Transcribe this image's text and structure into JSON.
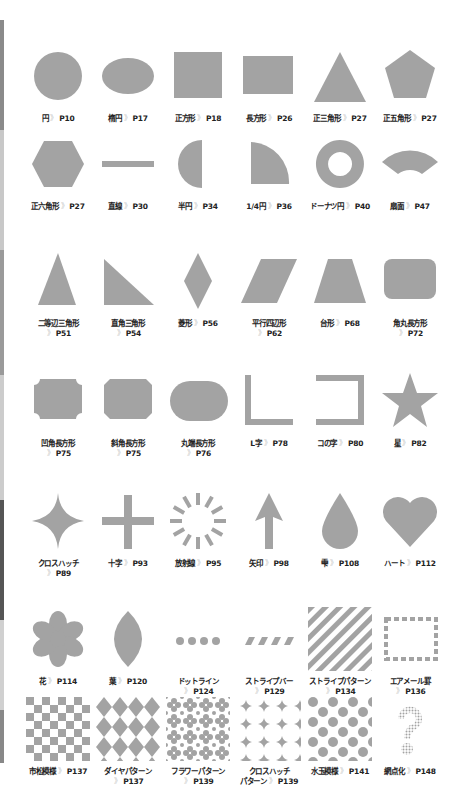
{
  "colors": {
    "shape": "#a3a3a3",
    "shape_dark": "#999999",
    "text": "#222222",
    "arrow": "#bbbbbb"
  },
  "edge_tabs": [
    {
      "top": 20,
      "height": 110,
      "color": "#8a8a8a"
    },
    {
      "top": 130,
      "height": 120,
      "color": "#c8c8c8"
    },
    {
      "top": 250,
      "height": 125,
      "color": "#9a9a9a"
    },
    {
      "top": 375,
      "height": 125,
      "color": "#cccccc"
    },
    {
      "top": 500,
      "height": 120,
      "color": "#555555"
    },
    {
      "top": 620,
      "height": 90,
      "color": "#d0d0d0"
    },
    {
      "top": 710,
      "height": 53,
      "color": "#888888"
    }
  ],
  "arrow_glyph": "》",
  "items": [
    {
      "name": "円",
      "page": "P10",
      "icon": "circle"
    },
    {
      "name": "楕円",
      "page": "P17",
      "icon": "ellipse"
    },
    {
      "name": "正方形",
      "page": "P18",
      "icon": "square"
    },
    {
      "name": "長方形",
      "page": "P26",
      "icon": "rectangle"
    },
    {
      "name": "正三角形",
      "page": "P27",
      "icon": "triangle"
    },
    {
      "name": "正五角形",
      "page": "P27",
      "icon": "pentagon"
    },
    {
      "name": "正六角形",
      "page": "P27",
      "icon": "hexagon"
    },
    {
      "name": "直線",
      "page": "P30",
      "icon": "line"
    },
    {
      "name": "半円",
      "page": "P34",
      "icon": "half-circle"
    },
    {
      "name": "1/4円",
      "page": "P36",
      "icon": "quarter-circle"
    },
    {
      "name": "ドーナツ円",
      "page": "P40",
      "icon": "donut"
    },
    {
      "name": "扇面",
      "page": "P47",
      "icon": "fan"
    },
    {
      "name": "二等辺三角形",
      "page": "P51",
      "icon": "isosceles-triangle",
      "wrap": true
    },
    {
      "name": "直角三角形",
      "page": "P54",
      "icon": "right-triangle",
      "wrap": true
    },
    {
      "name": "菱形",
      "page": "P56",
      "icon": "diamond"
    },
    {
      "name": "平行四辺形",
      "page": "P62",
      "icon": "parallelogram",
      "wrap": true
    },
    {
      "name": "台形",
      "page": "P68",
      "icon": "trapezoid"
    },
    {
      "name": "角丸長方形",
      "page": "P72",
      "icon": "rounded-rectangle",
      "wrap": true
    },
    {
      "name": "凹角長方形",
      "page": "P75",
      "icon": "notched-rectangle",
      "wrap": true
    },
    {
      "name": "斜角長方形",
      "page": "P75",
      "icon": "beveled-rectangle",
      "wrap": true
    },
    {
      "name": "丸端長方形",
      "page": "P76",
      "icon": "stadium",
      "wrap": true
    },
    {
      "name": "L字",
      "page": "P78",
      "icon": "l-shape"
    },
    {
      "name": "コの字",
      "page": "P80",
      "icon": "bracket"
    },
    {
      "name": "星",
      "page": "P82",
      "icon": "star"
    },
    {
      "name": "クロスハッチ",
      "page": "P89",
      "icon": "four-point-star",
      "wrap": true
    },
    {
      "name": "十字",
      "page": "P93",
      "icon": "cross"
    },
    {
      "name": "放射線",
      "page": "P95",
      "icon": "radial-lines"
    },
    {
      "name": "矢印",
      "page": "P98",
      "icon": "arrow-up"
    },
    {
      "name": "雫",
      "page": "P108",
      "icon": "drop"
    },
    {
      "name": "ハート",
      "page": "P112",
      "icon": "heart"
    },
    {
      "name": "花",
      "page": "P114",
      "icon": "flower"
    },
    {
      "name": "葉",
      "page": "P120",
      "icon": "leaf"
    },
    {
      "name": "ドットライン",
      "page": "P124",
      "icon": "dot-line",
      "wrap": true
    },
    {
      "name": "ストライプバー",
      "page": "P129",
      "icon": "stripe-bar",
      "wrap": true
    },
    {
      "name": "ストライプパターン",
      "page": "P134",
      "icon": "stripe-pattern",
      "wrap": true
    },
    {
      "name": "エアメール罫",
      "page": "P136",
      "icon": "airmail-border",
      "wrap": true
    },
    {
      "name": "市松模様",
      "page": "P137",
      "icon": "checker-pattern"
    },
    {
      "name": "ダイヤパターン",
      "page": "P137",
      "icon": "diamond-pattern",
      "wrap": true
    },
    {
      "name": "フラワーパターン",
      "page": "P139",
      "icon": "flower-pattern",
      "wrap": true
    },
    {
      "name": "クロスハッチパターン",
      "page": "P139",
      "icon": "crosshatch-pattern",
      "wrap": true,
      "split": [
        "クロスハッチ",
        "パターン"
      ]
    },
    {
      "name": "水玉模様",
      "page": "P141",
      "icon": "polka-dot-pattern"
    },
    {
      "name": "網点化",
      "page": "P148",
      "icon": "halftone-question"
    }
  ]
}
